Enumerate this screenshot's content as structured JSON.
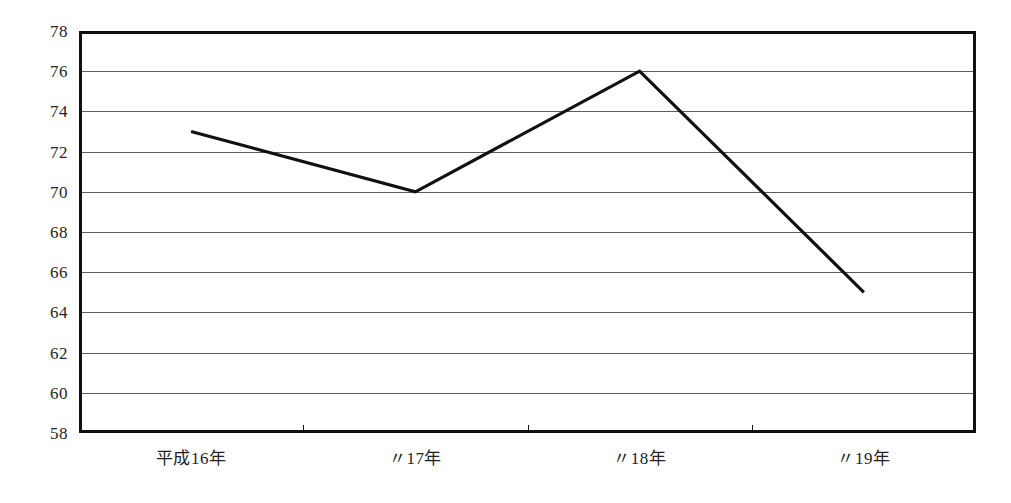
{
  "chart_data": {
    "type": "line",
    "title": "",
    "xlabel": "",
    "ylabel": "",
    "categories": [
      "平成16年",
      "〃17年",
      "〃18年",
      "〃19年"
    ],
    "values": [
      73,
      70,
      76,
      65
    ],
    "series": [
      {
        "name": "",
        "values": [
          73,
          70,
          76,
          65
        ]
      }
    ],
    "ylim": [
      58,
      78
    ],
    "ytick_values": [
      78,
      76,
      74,
      72,
      70,
      68,
      66,
      64,
      62,
      60,
      58
    ],
    "ytick_labels": [
      "78",
      "76",
      "74",
      "72",
      "70",
      "68",
      "66",
      "64",
      "62",
      "60",
      "58"
    ],
    "grid": true,
    "legend": "none",
    "line_color": "#111111",
    "grid_color": "#5d5d5d",
    "frame_color": "#111111",
    "background_color": "#ffffff"
  }
}
